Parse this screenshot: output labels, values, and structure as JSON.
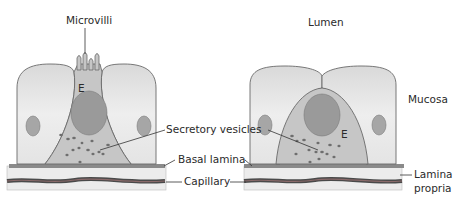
{
  "labels": {
    "microvilli": "Microvilli",
    "lumen": "Lumen",
    "mucosa": "Mucosa",
    "secretory_vesicles": "Secretory vesicles",
    "basal_lamina": "Basal lamina",
    "capillary": "Capillary",
    "lamina_propria_line1": "Lamina",
    "lamina_propria_line2": "propria",
    "cell_left": "E",
    "cell_right": "E"
  },
  "colors": {
    "cell_fill": "#e6e6e6",
    "cell_stroke": "#6a6a6a",
    "endocrine_fill": "#c4c4c4",
    "nucleus": "#9a9a9a",
    "vesicle": "#6e6e6e",
    "basal_lamina": "#8a8a8a",
    "lamina_propria": "#ececec",
    "capillary": "#5a5a5a",
    "leader": "#333333"
  }
}
